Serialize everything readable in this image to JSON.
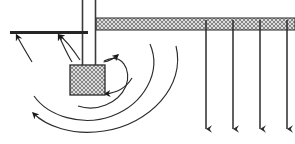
{
  "figure": {
    "title": "",
    "background_color": "#ffffff",
    "width": 295,
    "height": 144,
    "stroke_color": "#1a1a1a",
    "hatch_color": "#8a8a8a",
    "hatch_fill": "#d8d8d8"
  },
  "elements": {
    "ceiling_beam": {
      "name": "hatched-horizontal-beam",
      "x": 96,
      "y": 18,
      "width": 199,
      "height": 12,
      "fill": "#d9d9d9",
      "hatch": "cross",
      "label": ""
    },
    "vertical_post": {
      "name": "vertical-post",
      "x_left": 82,
      "x_right": 95,
      "y_top": 0,
      "y_bottom": 66,
      "label": ""
    },
    "block": {
      "name": "hatched-block",
      "x": 70,
      "y": 65,
      "width": 35,
      "height": 30,
      "fill": "#d9d9d9",
      "hatch": "cross",
      "label": ""
    },
    "reaction_bar": {
      "name": "thin-horizontal-bar",
      "x_start": 10,
      "x_end": 88,
      "y": 32,
      "thickness": 3,
      "label": ""
    }
  },
  "arcs": [
    {
      "name": "inner-rotation-arc",
      "radius": 38,
      "arrow_label": ""
    },
    {
      "name": "middle-rotation-arc",
      "radius": 62,
      "arrow_label": ""
    },
    {
      "name": "outer-rotation-arc",
      "radius": 88,
      "arrow_label": ""
    }
  ],
  "up_arrows": [
    {
      "name": "reaction-arrow-left",
      "x_tip": 16,
      "y_tip": 34,
      "x_tail": 30,
      "y_tail": 58
    },
    {
      "name": "reaction-arrow-right",
      "x_tip": 58,
      "y_tip": 34,
      "x_tail": 70,
      "y_tail": 58
    }
  ],
  "down_arrows": [
    {
      "name": "load-arrow-1",
      "x": 206,
      "y_start": 30,
      "y_end": 131,
      "label": ""
    },
    {
      "name": "load-arrow-2",
      "x": 233,
      "y_start": 30,
      "y_end": 131,
      "label": ""
    },
    {
      "name": "load-arrow-3",
      "x": 260,
      "y_start": 30,
      "y_end": 131,
      "label": ""
    },
    {
      "name": "load-arrow-4",
      "x": 287,
      "y_start": 30,
      "y_end": 131,
      "label": ""
    }
  ],
  "annotations": []
}
